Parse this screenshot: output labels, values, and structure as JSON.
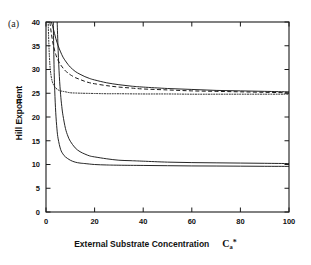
{
  "figure": {
    "panel_label": "(a)",
    "background_color": "#ffffff",
    "line_color": "#1a1a1a"
  },
  "axis_labels": {
    "x_text": "External Substrate Concentration",
    "x_symbol_base": "C",
    "x_symbol_sub": "a",
    "x_symbol_sup": "*",
    "y_text": "Hill Exponent",
    "y_symbol": "n"
  },
  "chart_data": {
    "type": "line",
    "title": "(a)",
    "xlabel": "External Substrate Concentration  Ca*",
    "ylabel": "Hill Exponent  n",
    "xlim": [
      0,
      100
    ],
    "ylim": [
      0,
      40
    ],
    "xticks": [
      0,
      20,
      40,
      60,
      80,
      100
    ],
    "yticks": [
      0,
      5,
      10,
      15,
      20,
      25,
      30,
      35,
      40
    ],
    "grid": false,
    "legend": "none",
    "tick_direction": "in",
    "frame": "box",
    "series": [
      {
        "name": "curve-1-solid-upper",
        "style": "solid",
        "asymptote": 25.2,
        "x": [
          2.2,
          3,
          4,
          5,
          6,
          7,
          8,
          9,
          10,
          12,
          14,
          16,
          18,
          20,
          25,
          30,
          35,
          40,
          50,
          60,
          70,
          80,
          90,
          100
        ],
        "y": [
          40.0,
          38.6,
          36.6,
          35.0,
          33.7,
          32.6,
          31.8,
          31.1,
          30.5,
          29.6,
          29.0,
          28.5,
          28.1,
          27.8,
          27.2,
          26.8,
          26.5,
          26.3,
          26.0,
          25.8,
          25.6,
          25.5,
          25.4,
          25.3
        ]
      },
      {
        "name": "curve-2-dashed",
        "style": "dashed",
        "asymptote": 25.0,
        "x": [
          1.6,
          2.2,
          3,
          4,
          5,
          6,
          7,
          8,
          9,
          10,
          12,
          14,
          16,
          18,
          20,
          25,
          30,
          35,
          40,
          50,
          60,
          70,
          80,
          90,
          100
        ],
        "y": [
          40.0,
          37.6,
          35.2,
          33.2,
          31.9,
          31.0,
          30.3,
          29.7,
          29.3,
          28.9,
          28.3,
          27.9,
          27.5,
          27.2,
          27.0,
          26.6,
          26.3,
          26.1,
          25.9,
          25.7,
          25.5,
          25.4,
          25.3,
          25.2,
          25.1
        ]
      },
      {
        "name": "curve-3-dotted",
        "style": "dotted",
        "asymptote": 24.8,
        "x": [
          0.9,
          1.2,
          1.6,
          2.0,
          2.5,
          3,
          3.5,
          4,
          5,
          6,
          7,
          8,
          10,
          12,
          15,
          20,
          25,
          30,
          40,
          50,
          60,
          70,
          80,
          90,
          100
        ],
        "y": [
          40.0,
          35.0,
          31.0,
          29.0,
          27.6,
          26.9,
          26.4,
          26.1,
          25.7,
          25.5,
          25.4,
          25.3,
          25.1,
          25.05,
          25.0,
          24.95,
          24.9,
          24.9,
          24.85,
          24.85,
          24.8,
          24.8,
          24.8,
          24.8,
          24.8
        ]
      },
      {
        "name": "curve-4-solid-mid",
        "style": "solid",
        "asymptote": 10.2,
        "x": [
          4.6,
          5,
          5.5,
          6,
          6.5,
          7,
          8,
          9,
          10,
          12,
          14,
          16,
          18,
          20,
          25,
          30,
          35,
          40,
          50,
          60,
          70,
          80,
          90,
          100
        ],
        "y": [
          40.0,
          34.0,
          28.5,
          24.8,
          22.2,
          20.3,
          17.6,
          16.0,
          14.9,
          13.5,
          12.7,
          12.2,
          11.8,
          11.6,
          11.2,
          10.9,
          10.8,
          10.7,
          10.5,
          10.4,
          10.35,
          10.3,
          10.25,
          10.2
        ]
      },
      {
        "name": "curve-5-solid-lower",
        "style": "solid",
        "asymptote": 9.6,
        "x": [
          3.0,
          3.3,
          3.6,
          4,
          4.5,
          5,
          6,
          7,
          8,
          10,
          12,
          14,
          16,
          20,
          25,
          30,
          40,
          50,
          60,
          70,
          80,
          90,
          100
        ],
        "y": [
          40.0,
          31.0,
          25.5,
          21.0,
          17.5,
          15.4,
          13.2,
          12.2,
          11.6,
          10.9,
          10.5,
          10.3,
          10.2,
          10.0,
          9.9,
          9.85,
          9.8,
          9.75,
          9.7,
          9.68,
          9.65,
          9.62,
          9.6
        ]
      }
    ]
  }
}
